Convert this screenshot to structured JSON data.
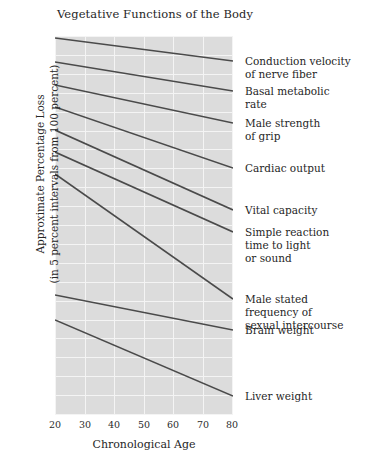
{
  "chart_data": {
    "type": "line",
    "title": "Vegetative Functions of the Body",
    "xlabel": "Chronological Age",
    "ylabel_line1": "Approximate Percentage Loss",
    "ylabel_line2": "(in 5 percent intervals from 100 percent)",
    "xlim": [
      20,
      80
    ],
    "ylim": [
      0,
      100
    ],
    "xticks": [
      20,
      30,
      40,
      50,
      60,
      70,
      80
    ],
    "xticklabels": [
      "20",
      "30",
      "40",
      "50",
      "60",
      "70",
      "80"
    ],
    "grid": true,
    "legend_position": "right-inline-labels",
    "y_axis_note": "Unlabeled; horizontal gridlines at 5 percent intervals from 100 percent",
    "series": [
      {
        "name": "Conduction velocity of nerve fiber",
        "label_lines": [
          "Conduction velocity",
          "of nerve fiber"
        ],
        "x": [
          20,
          80
        ],
        "y": [
          100,
          85
        ],
        "start_px_y": 38,
        "end_px_y": 61
      },
      {
        "name": "Basal metabolic rate",
        "label_lines": [
          "Basal metabolic",
          "rate"
        ],
        "x": [
          20,
          80
        ],
        "y": [
          100,
          82
        ],
        "start_px_y": 62,
        "end_px_y": 91
      },
      {
        "name": "Male strength of grip",
        "label_lines": [
          "Male strength",
          "of grip"
        ],
        "x": [
          20,
          80
        ],
        "y": [
          100,
          78
        ],
        "start_px_y": 85,
        "end_px_y": 123
      },
      {
        "name": "Cardiac output",
        "label_lines": [
          "Cardiac output"
        ],
        "x": [
          20,
          80
        ],
        "y": [
          100,
          72
        ],
        "start_px_y": 107,
        "end_px_y": 168
      },
      {
        "name": "Vital capacity",
        "label_lines": [
          "Vital capacity"
        ],
        "x": [
          20,
          80
        ],
        "y": [
          100,
          66
        ],
        "start_px_y": 130,
        "end_px_y": 210
      },
      {
        "name": "Simple reaction time to light or sound",
        "label_lines": [
          "Simple reaction",
          "time to light",
          "or sound"
        ],
        "x": [
          20,
          80
        ],
        "y": [
          100,
          62
        ],
        "start_px_y": 152,
        "end_px_y": 232
      },
      {
        "name": "Male stated frequency of sexual intercourse",
        "label_lines": [
          "Male stated",
          "frequency of",
          "sexual intercourse"
        ],
        "x": [
          20,
          80
        ],
        "y": [
          100,
          42
        ],
        "start_px_y": 174,
        "end_px_y": 299
      },
      {
        "name": "Brain weight",
        "label_lines": [
          "Brain weight"
        ],
        "x": [
          20,
          80
        ],
        "y": [
          100,
          91
        ],
        "start_px_y": 295,
        "end_px_y": 330
      },
      {
        "name": "Liver weight",
        "label_lines": [
          "Liver weight"
        ],
        "x": [
          20,
          80
        ],
        "y": [
          100,
          84
        ],
        "start_px_y": 320,
        "end_px_y": 396
      }
    ]
  },
  "colors": {
    "plot_background": "#dcdcdc",
    "gridline": "#f4f4f4",
    "line": "#4a4a4a",
    "text": "#1f1f1f",
    "page_background": "#ffffff"
  }
}
